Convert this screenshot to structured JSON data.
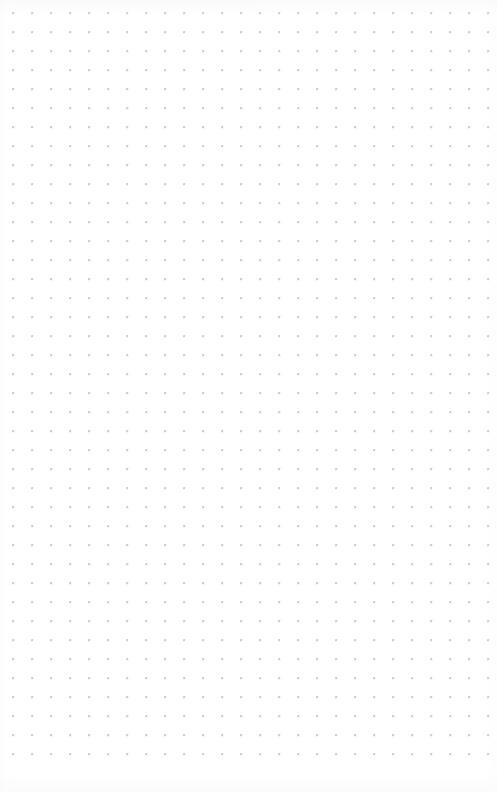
{
  "page": {
    "kind": "dot-grid-paper",
    "width": 497,
    "height": 792,
    "background_color": "#ffffff",
    "text_content": ""
  },
  "grid": {
    "dot_color": "#b9b9c0",
    "dot_diameter": 1.5,
    "spacing_x": 19,
    "spacing_y": 19,
    "origin_x": 13,
    "origin_y": 13,
    "columns": 26,
    "rows": 40,
    "first_dot_label": "13, 13",
    "last_dot_label": "489, 765"
  }
}
